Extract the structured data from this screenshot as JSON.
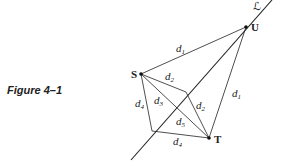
{
  "caption": "Figure 4–1",
  "line_label": "ℒ",
  "points": {
    "U": "U",
    "S": "S",
    "T": "T"
  },
  "distances": {
    "d1": {
      "base": "d",
      "sub": "1"
    },
    "d2": {
      "base": "d",
      "sub": "2"
    },
    "d3": {
      "base": "d",
      "sub": "3"
    },
    "d4": {
      "base": "d",
      "sub": "4"
    },
    "d5": {
      "base": "d",
      "sub": "5"
    }
  }
}
